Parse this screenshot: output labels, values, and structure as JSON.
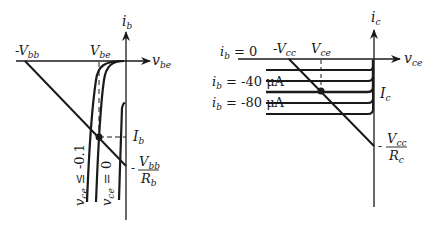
{
  "left_plot": {
    "y_axis_label": "i",
    "y_axis_sub": "b",
    "x_axis_label": "v",
    "x_axis_sub": "be",
    "neg_vbb_label": "-V",
    "neg_vbb_sub": "bb",
    "vbe_label": "V",
    "vbe_sub": "be",
    "ib_label": "I",
    "ib_sub": "b",
    "intercept_sign": "-",
    "intercept_num": "V",
    "intercept_num_sub": "bb",
    "intercept_den": "R",
    "intercept_den_sub": "b",
    "curve1_label_var": "v",
    "curve1_label_sub": "ce",
    "curve1_label_rel": " ≤ -0.1",
    "curve2_label_var": "v",
    "curve2_label_sub": "ce",
    "curve2_label_rel": " = 0"
  },
  "right_plot": {
    "y_axis_label": "i",
    "y_axis_sub": "c",
    "x_axis_label": "v",
    "x_axis_sub": "ce",
    "neg_vcc_label": "-V",
    "neg_vcc_sub": "cc",
    "vce_label": "V",
    "vce_sub": "ce",
    "ic_label": "I",
    "ic_sub": "c",
    "intercept_sign": "-",
    "intercept_num": "V",
    "intercept_num_sub": "cc",
    "intercept_den": "R",
    "intercept_den_sub": "c",
    "curve_labels": [
      {
        "var": "i",
        "sub": "b",
        "rel": " = 0"
      },
      {
        "var": "i",
        "sub": "b",
        "rel": " = -40 μA"
      },
      {
        "var": "i",
        "sub": "b",
        "rel": " = -80 μA"
      }
    ]
  }
}
